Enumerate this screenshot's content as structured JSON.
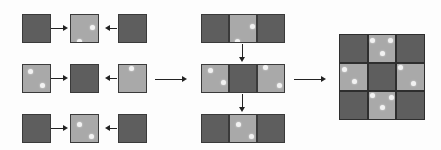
{
  "colors": {
    "dark_tile": "#5e5e5e",
    "light_tile": "#a9a9a9",
    "dot": "#f2f2f2",
    "border": "#3a3a3a",
    "arrow": "#222222",
    "background": "#fdfdfd"
  },
  "stage1": {
    "rows": [
      {
        "tiles": [
          {
            "shade": "dark",
            "dots": []
          },
          {
            "shade": "light",
            "dots": [
              [
                19,
                10
              ],
              [
                6,
                24
              ]
            ]
          },
          {
            "shade": "dark",
            "dots": []
          }
        ],
        "arrows": [
          "right",
          "left"
        ]
      },
      {
        "tiles": [
          {
            "shade": "light",
            "dots": [
              [
                5,
                4
              ],
              [
                17,
                18
              ]
            ]
          },
          {
            "shade": "dark",
            "dots": []
          },
          {
            "shade": "light",
            "dots": [
              [
                10,
                1
              ]
            ]
          }
        ],
        "arrows": [
          "right",
          "left"
        ]
      },
      {
        "tiles": [
          {
            "shade": "dark",
            "dots": []
          },
          {
            "shade": "light",
            "dots": [
              [
                6,
                7
              ],
              [
                18,
                19
              ]
            ]
          },
          {
            "shade": "dark",
            "dots": []
          }
        ],
        "arrows": [
          "right",
          "left"
        ]
      }
    ]
  },
  "stage2": {
    "rows": [
      {
        "tiles": [
          {
            "shade": "dark",
            "dots": []
          },
          {
            "shade": "light",
            "dots": [
              [
                20,
                9
              ],
              [
                5,
                24
              ]
            ]
          },
          {
            "shade": "dark",
            "dots": []
          }
        ]
      },
      {
        "tiles": [
          {
            "shade": "light",
            "dots": [
              [
                6,
                3
              ],
              [
                19,
                15
              ]
            ]
          },
          {
            "shade": "dark",
            "dots": []
          },
          {
            "shade": "light",
            "dots": [
              [
                5,
                0
              ],
              [
                19,
                18
              ]
            ]
          }
        ]
      },
      {
        "tiles": [
          {
            "shade": "dark",
            "dots": []
          },
          {
            "shade": "light",
            "dots": [
              [
                6,
                7
              ],
              [
                19,
                19
              ]
            ]
          },
          {
            "shade": "dark",
            "dots": []
          }
        ]
      }
    ],
    "down_arrows": 2
  },
  "stage3": {
    "grid": [
      [
        {
          "shade": "dark",
          "dots": []
        },
        {
          "shade": "light",
          "dots": [
            [
              1,
              3
            ],
            [
              19,
              3
            ],
            [
              11,
              16
            ]
          ]
        },
        {
          "shade": "dark",
          "dots": []
        }
      ],
      [
        {
          "shade": "light",
          "dots": [
            [
              2,
              3
            ],
            [
              12,
              15
            ]
          ]
        },
        {
          "shade": "dark",
          "dots": []
        },
        {
          "shade": "light",
          "dots": [
            [
              1,
              1
            ],
            [
              14,
              17
            ]
          ]
        }
      ],
      [
        {
          "shade": "dark",
          "dots": []
        },
        {
          "shade": "light",
          "dots": [
            [
              1,
              1
            ],
            [
              20,
              3
            ],
            [
              11,
              13
            ]
          ]
        },
        {
          "shade": "dark",
          "dots": []
        }
      ]
    ]
  },
  "connectors": [
    {
      "from": "stage1",
      "to": "stage2",
      "direction": "right"
    },
    {
      "from": "stage2",
      "to": "stage3",
      "direction": "right"
    }
  ]
}
